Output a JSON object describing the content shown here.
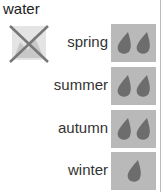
{
  "title": "water",
  "not_allowed_icon": "crossed-out-image-icon",
  "colors": {
    "box": "#b9b9b9",
    "drop": "#6d6d6d",
    "cross": "#777777"
  },
  "seasons": [
    {
      "label": "spring",
      "drops": 2
    },
    {
      "label": "summer",
      "drops": 2
    },
    {
      "label": "autumn",
      "drops": 2
    },
    {
      "label": "winter",
      "drops": 1
    }
  ]
}
